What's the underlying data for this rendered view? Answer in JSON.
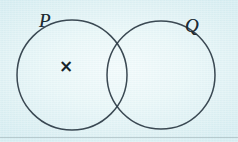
{
  "figure": {
    "kind": "venn-diagram",
    "caption": "",
    "background_color": "#e6f4f6",
    "ink_color": "#2b3a44",
    "paper_tint": "#ddf0f3"
  },
  "sets": [
    {
      "id": "P",
      "label": "P",
      "label_style": "italic-serif",
      "cx": 72,
      "cy": 75,
      "r": 55,
      "stroke": "#2b3a44"
    },
    {
      "id": "Q",
      "label": "Q",
      "label_style": "italic-serif",
      "cx": 161,
      "cy": 75,
      "r": 54,
      "stroke": "#2b3a44"
    }
  ],
  "marks": [
    {
      "id": "element-x",
      "glyph": "×",
      "icon_name": "cross-mark-icon",
      "x": 66,
      "y": 67,
      "region": "P-only",
      "color": "#17242b"
    }
  ],
  "intersections": {
    "upper_point": "118, 39",
    "lower_point": "118, 113"
  },
  "artifacts": {
    "scan_line_y": 137
  }
}
